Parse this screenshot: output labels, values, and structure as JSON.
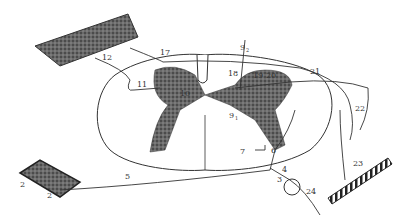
{
  "diagram": {
    "labels": {
      "l2": "2",
      "l2sub": "2",
      "l4": "4",
      "l5": "5",
      "l6": "6",
      "l7": "7",
      "l9_1": "9",
      "l9_1sub": "1",
      "l9_2": "9",
      "l9_2sub": "2",
      "l10": "10",
      "l11": "11",
      "l12": "12",
      "l17": "17",
      "l18": "18",
      "l19": "19",
      "l20": "20",
      "l21": "21",
      "l22": "22",
      "l23": "23",
      "l24": "24"
    },
    "colors": {
      "line": "#333333",
      "gray_matter": "#4a4a4a",
      "tissue": "#5a5a5a"
    }
  }
}
